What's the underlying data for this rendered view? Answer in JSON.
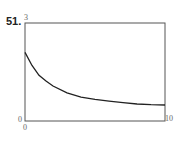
{
  "problem_number": "51.",
  "labels": {
    "y_max": "3",
    "y_min": "0",
    "x_min": "0",
    "x_max": "10"
  },
  "colors": {
    "frame": "#555555",
    "curve": "#222222"
  },
  "chart_data": {
    "type": "line",
    "title": "",
    "xlabel": "",
    "ylabel": "",
    "xlim": [
      0,
      10
    ],
    "ylim": [
      0,
      3
    ],
    "grid": false,
    "legend": null,
    "x": [
      0,
      0.5,
      1,
      1.5,
      2,
      3,
      4,
      5,
      6,
      7,
      8,
      9,
      10
    ],
    "series": [
      {
        "name": "f(x)",
        "values": [
          2.1,
          1.7,
          1.4,
          1.22,
          1.07,
          0.86,
          0.73,
          0.66,
          0.61,
          0.56,
          0.52,
          0.5,
          0.49
        ]
      }
    ]
  }
}
